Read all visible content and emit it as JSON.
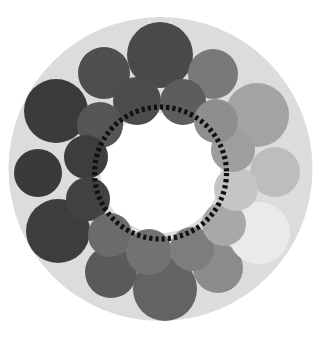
{
  "figure": {
    "title": "",
    "canvas": {
      "width": 317,
      "height": 337,
      "background": "#ffffff"
    },
    "backdrop_disc": {
      "name": "background-disc",
      "cx": 160.5,
      "cy": 169.0,
      "r": 152.0,
      "color": "#dcdcdc"
    },
    "inner_hole": {
      "name": "inner-white-hole",
      "cx": 160.5,
      "cy": 173.0,
      "r": 60.0,
      "color": "#ffffff"
    },
    "dotted_ring": {
      "name": "dotted-boundary-ring",
      "cx": 160.5,
      "cy": 173.0,
      "r": 66.0,
      "color": "#111111",
      "stroke_width": 5.2,
      "dash": "3.2 3.0",
      "style": "dotted"
    }
  },
  "chart_data": {
    "type": "scatter",
    "subtype": "circle-packing-ring",
    "title": "",
    "xlabel": "",
    "ylabel": "",
    "grid": false,
    "legend": null,
    "xlim": [
      0,
      317
    ],
    "ylim": [
      0,
      337
    ],
    "colormap": "greys",
    "value_range": [
      0.0,
      1.0
    ],
    "circles": [
      {
        "id": "outer-top",
        "cx": 160,
        "cy": 55,
        "r": 33,
        "color": "#4a4a4a",
        "value": 0.29,
        "ring": "outer"
      },
      {
        "id": "outer-top-left",
        "cx": 104,
        "cy": 73,
        "r": 26,
        "color": "#4e4e4e",
        "value": 0.31,
        "ring": "outer"
      },
      {
        "id": "outer-left-upper",
        "cx": 56,
        "cy": 111,
        "r": 32,
        "color": "#3b3b3b",
        "value": 0.23,
        "ring": "outer"
      },
      {
        "id": "outer-left-mid",
        "cx": 38,
        "cy": 173,
        "r": 24,
        "color": "#3a3a3a",
        "value": 0.23,
        "ring": "outer"
      },
      {
        "id": "outer-left-lower",
        "cx": 58,
        "cy": 231,
        "r": 32,
        "color": "#3d3d3d",
        "value": 0.24,
        "ring": "outer"
      },
      {
        "id": "outer-bottom-left",
        "cx": 111,
        "cy": 272,
        "r": 26,
        "color": "#5a5a5a",
        "value": 0.35,
        "ring": "outer"
      },
      {
        "id": "outer-bottom",
        "cx": 165,
        "cy": 289,
        "r": 32,
        "color": "#636363",
        "value": 0.39,
        "ring": "outer"
      },
      {
        "id": "outer-bottom-right",
        "cx": 218,
        "cy": 268,
        "r": 25,
        "color": "#8b8b8b",
        "value": 0.55,
        "ring": "outer"
      },
      {
        "id": "outer-right-lower",
        "cx": 259,
        "cy": 233,
        "r": 31,
        "color": "#eaeaea",
        "value": 0.92,
        "ring": "outer"
      },
      {
        "id": "outer-right-mid",
        "cx": 275,
        "cy": 172,
        "r": 25,
        "color": "#bdbdbd",
        "value": 0.74,
        "ring": "outer"
      },
      {
        "id": "outer-right-upper",
        "cx": 257,
        "cy": 115,
        "r": 32,
        "color": "#a3a3a3",
        "value": 0.64,
        "ring": "outer"
      },
      {
        "id": "outer-top-right",
        "cx": 213,
        "cy": 74,
        "r": 25,
        "color": "#797979",
        "value": 0.47,
        "ring": "outer"
      },
      {
        "id": "inner-top-left-a",
        "cx": 137,
        "cy": 101,
        "r": 24,
        "color": "#4c4c4c",
        "value": 0.3,
        "ring": "inner"
      },
      {
        "id": "inner-top-right-a",
        "cx": 183,
        "cy": 102,
        "r": 23,
        "color": "#5d5d5d",
        "value": 0.36,
        "ring": "inner"
      },
      {
        "id": "inner-left-upper",
        "cx": 100,
        "cy": 125,
        "r": 23,
        "color": "#555555",
        "value": 0.33,
        "ring": "inner"
      },
      {
        "id": "inner-left-a",
        "cx": 86,
        "cy": 157,
        "r": 22,
        "color": "#3d3d3d",
        "value": 0.24,
        "ring": "inner"
      },
      {
        "id": "inner-left-b",
        "cx": 88,
        "cy": 199,
        "r": 22,
        "color": "#424242",
        "value": 0.26,
        "ring": "inner"
      },
      {
        "id": "inner-bottom-left",
        "cx": 110,
        "cy": 235,
        "r": 22,
        "color": "#6b6b6b",
        "value": 0.42,
        "ring": "inner"
      },
      {
        "id": "inner-bottom-a",
        "cx": 149,
        "cy": 252,
        "r": 23,
        "color": "#727272",
        "value": 0.45,
        "ring": "inner"
      },
      {
        "id": "inner-bottom-b",
        "cx": 192,
        "cy": 249,
        "r": 22,
        "color": "#7d7d7d",
        "value": 0.49,
        "ring": "inner"
      },
      {
        "id": "inner-right-lower",
        "cx": 224,
        "cy": 224,
        "r": 22,
        "color": "#a8a8a8",
        "value": 0.66,
        "ring": "inner"
      },
      {
        "id": "inner-right-b",
        "cx": 236,
        "cy": 189,
        "r": 22,
        "color": "#c5c5c5",
        "value": 0.77,
        "ring": "inner"
      },
      {
        "id": "inner-right-a",
        "cx": 233,
        "cy": 150,
        "r": 22,
        "color": "#9e9e9e",
        "value": 0.62,
        "ring": "inner"
      },
      {
        "id": "inner-top-right-b",
        "cx": 216,
        "cy": 121,
        "r": 22,
        "color": "#8e8e8e",
        "value": 0.56,
        "ring": "inner"
      }
    ]
  }
}
